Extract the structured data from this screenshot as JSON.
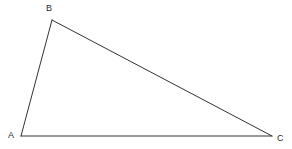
{
  "figure": {
    "name": "triangle-abc",
    "background_color": "#ffffff",
    "stroke_color": "#333333",
    "stroke_width": 1,
    "width": 292,
    "height": 149
  },
  "vertices": [
    {
      "id": "A",
      "label": "A",
      "x": 21,
      "y": 136,
      "label_x": 8,
      "label_y": 131
    },
    {
      "id": "B",
      "label": "B",
      "x": 52,
      "y": 20,
      "label_x": 46,
      "label_y": 4
    },
    {
      "id": "C",
      "label": "C",
      "x": 272,
      "y": 136,
      "label_x": 277,
      "label_y": 134
    }
  ],
  "edges": [
    {
      "id": "AB",
      "from": "A",
      "to": "B",
      "points": "21,136 52,20"
    },
    {
      "id": "BC",
      "from": "B",
      "to": "C",
      "points": "52,20 272,136"
    },
    {
      "id": "CA",
      "from": "C",
      "to": "A",
      "points": "272,136 21,136"
    }
  ],
  "polygon_points": "21,136 52,20 272,136"
}
